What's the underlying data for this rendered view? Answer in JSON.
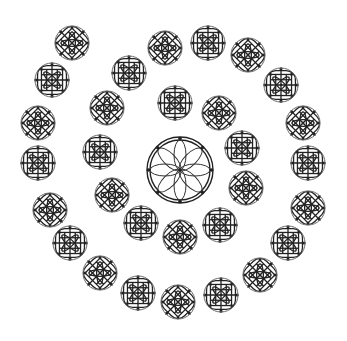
{
  "figure": {
    "background": "#ffffff",
    "stroke_color": "#222222",
    "outer_stroke_color": "#6a6a6a"
  },
  "center_rosette": {
    "cx": 180,
    "cy": 170,
    "r": 30,
    "petals": 8
  },
  "motif_radius": 17,
  "motifs": [
    {
      "cx": 175,
      "cy": 103
    },
    {
      "cx": 219,
      "cy": 113
    },
    {
      "cx": 242,
      "cy": 148
    },
    {
      "cx": 246,
      "cy": 188
    },
    {
      "cx": 220,
      "cy": 225
    },
    {
      "cx": 180,
      "cy": 237
    },
    {
      "cx": 141,
      "cy": 223
    },
    {
      "cx": 112,
      "cy": 195
    },
    {
      "cx": 100,
      "cy": 152
    },
    {
      "cx": 107,
      "cy": 108
    },
    {
      "cx": 129,
      "cy": 73
    },
    {
      "cx": 165,
      "cy": 48
    },
    {
      "cx": 208,
      "cy": 43
    },
    {
      "cx": 248,
      "cy": 55
    },
    {
      "cx": 281,
      "cy": 85
    },
    {
      "cx": 303,
      "cy": 123
    },
    {
      "cx": 308,
      "cy": 163
    },
    {
      "cx": 308,
      "cy": 208
    },
    {
      "cx": 288,
      "cy": 243
    },
    {
      "cx": 260,
      "cy": 275
    },
    {
      "cx": 221,
      "cy": 295
    },
    {
      "cx": 178,
      "cy": 302
    },
    {
      "cx": 138,
      "cy": 293
    },
    {
      "cx": 100,
      "cy": 273
    },
    {
      "cx": 70,
      "cy": 243
    },
    {
      "cx": 50,
      "cy": 210
    },
    {
      "cx": 38,
      "cy": 163
    },
    {
      "cx": 38,
      "cy": 123
    },
    {
      "cx": 52,
      "cy": 80
    },
    {
      "cx": 72,
      "cy": 43
    }
  ]
}
